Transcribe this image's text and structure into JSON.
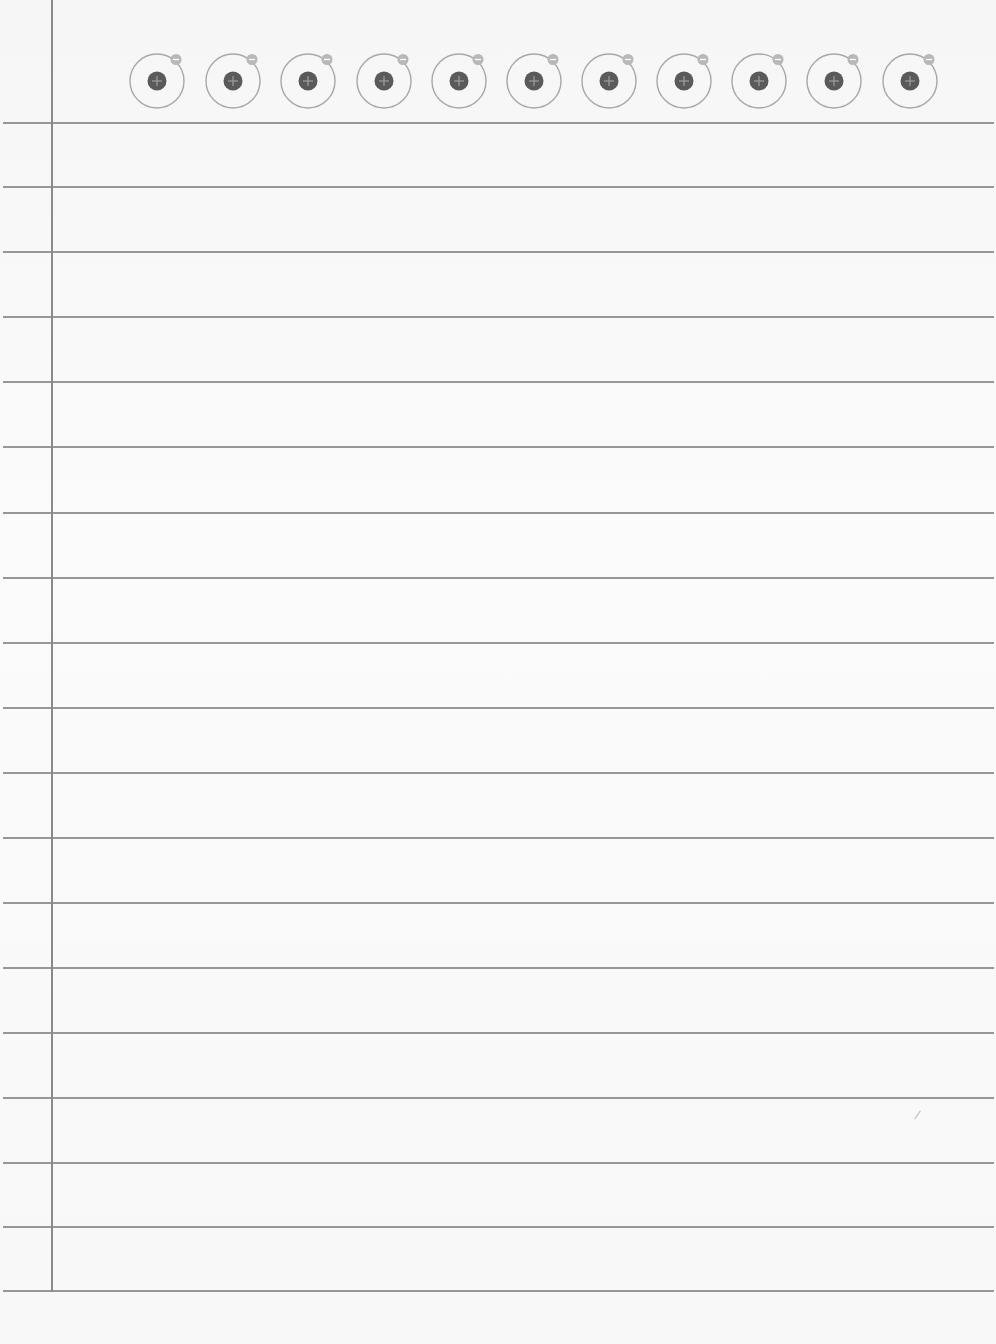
{
  "page": {
    "type": "lined-notebook-paper",
    "background_color": "#f9f9f9",
    "rule_color": "#8c8c8c",
    "margin_line_color": "#8a8a8a"
  },
  "header": {
    "atom_count": 11,
    "atom_icon": "atom-icon",
    "atom_centers_x": [
      157,
      233,
      308,
      384,
      459,
      534,
      609,
      684,
      759,
      834,
      910
    ],
    "atom_center_y": 81,
    "colors": {
      "orbit": "#a8a8a8",
      "nucleus": "#5a5a5a",
      "nucleus_symbol": "#9a9a9a",
      "electron": "#b8b8b8",
      "electron_symbol": "#ffffff"
    },
    "nucleus_symbol": "+",
    "electron_symbol": "−"
  },
  "rules": {
    "y_positions": [
      123,
      187,
      252,
      317,
      382,
      447,
      513,
      578,
      643,
      708,
      773,
      838,
      903,
      968,
      1033,
      1098,
      1163,
      1227,
      1291
    ]
  },
  "margin": {
    "x": 52
  }
}
